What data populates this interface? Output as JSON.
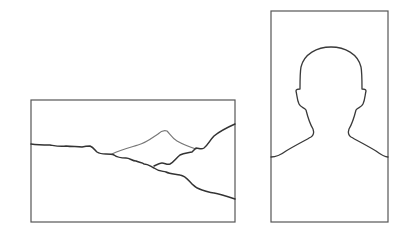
{
  "diagram": {
    "panels": [
      {
        "id": "landscape",
        "label": "Landscape format",
        "content": "mountain-landscape-line-drawing",
        "frame": {
          "x": 31,
          "y": 100,
          "width": 204,
          "height": 122
        }
      },
      {
        "id": "portrait",
        "label": "Portrait format",
        "content": "head-and-shoulders-silhouette",
        "frame": {
          "x": 271,
          "y": 11,
          "width": 117,
          "height": 211
        }
      }
    ],
    "colors": {
      "background": "#ffffff",
      "frame_stroke": "#555555",
      "line_dark": "#333333",
      "line_light": "#777777"
    }
  }
}
